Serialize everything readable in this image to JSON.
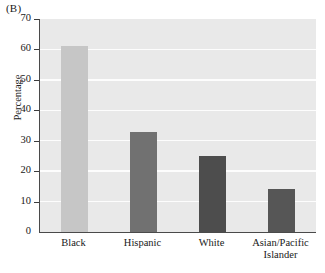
{
  "figure": {
    "panel_label": "(B)",
    "ylabel": "Percentage"
  },
  "chart_data": {
    "type": "bar",
    "title": "",
    "subtitle": "",
    "xlabel": "",
    "ylabel": "Percentage",
    "ylim": [
      0,
      70
    ],
    "ytick_values": [
      0,
      10,
      20,
      30,
      40,
      50,
      60,
      70
    ],
    "ytick_labels": [
      "0",
      "10",
      "20",
      "30",
      "40",
      "50",
      "60",
      "70"
    ],
    "grid": true,
    "grid_axis": "y",
    "grid_color": "#fdfdfd",
    "legend": false,
    "plot_background": "#e9e9e9",
    "categories": [
      "Black",
      "Hispanic",
      "White",
      "Asian/Pacific Islander"
    ],
    "category_lines": [
      [
        "Black"
      ],
      [
        "Hispanic"
      ],
      [
        "White"
      ],
      [
        "Asian/Pacific",
        "Islander"
      ]
    ],
    "values": [
      61,
      33,
      25,
      14
    ],
    "bar_colors": [
      "#c6c6c6",
      "#717171",
      "#4d4d4d",
      "#565656"
    ],
    "series": [
      {
        "name": "Percentage",
        "values": [
          61,
          33,
          25,
          14
        ]
      }
    ]
  }
}
